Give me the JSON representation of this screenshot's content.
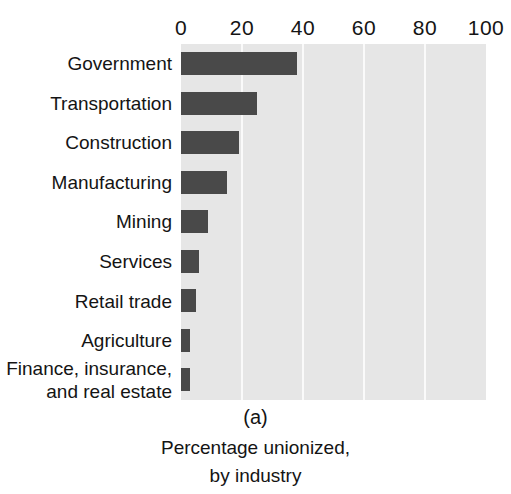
{
  "chart_data": {
    "type": "bar",
    "orientation": "horizontal",
    "title": "",
    "panel_label": "(a)",
    "caption_lines": [
      "Percentage unionized,",
      "by industry"
    ],
    "xlabel": "",
    "ylabel": "",
    "xlim": [
      0,
      100
    ],
    "xticks": [
      0,
      20,
      40,
      60,
      80,
      100
    ],
    "xtick_labels": [
      "0",
      "20",
      "40",
      "60",
      "80",
      "100"
    ],
    "grid": true,
    "grid_axis": "x",
    "legend": "none",
    "categories": [
      "Government",
      "Transportation",
      "Construction",
      "Manufacturing",
      "Mining",
      "Services",
      "Retail trade",
      "Agriculture",
      "Finance, insurance, and real estate"
    ],
    "category_label_lines": [
      [
        "Government"
      ],
      [
        "Transportation"
      ],
      [
        "Construction"
      ],
      [
        "Manufacturing"
      ],
      [
        "Mining"
      ],
      [
        "Services"
      ],
      [
        "Retail trade"
      ],
      [
        "Agriculture"
      ],
      [
        "Finance, insurance,",
        "and real estate"
      ]
    ],
    "values": [
      38,
      25,
      19,
      15,
      9,
      6,
      5,
      3,
      3
    ],
    "colors": {
      "bar": "#494949",
      "plot_background": "#e6e6e6",
      "gridline": "#fafafa",
      "text": "#141414",
      "page_background": "#ffffff"
    }
  }
}
